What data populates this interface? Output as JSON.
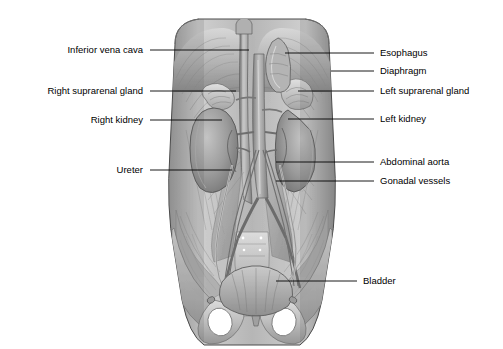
{
  "figure": {
    "view": "anterior view of posterior abdominal wall and pelvis",
    "style": "grayscale medical illustration",
    "background_color": "#ffffff",
    "leader_line_color": "#000000",
    "label_text_color": "#000000"
  },
  "labels_left": [
    {
      "id": "inferior-vena-cava",
      "text": "Inferior vena cava",
      "text_x": 143,
      "text_y": 50,
      "line_x1": 150,
      "line_x2": 249,
      "line_y": 50
    },
    {
      "id": "right-suprarenal-gland",
      "text": "Right suprarenal gland",
      "text_x": 143,
      "text_y": 91,
      "line_x1": 150,
      "line_x2": 236,
      "line_y": 91
    },
    {
      "id": "right-kidney",
      "text": "Right kidney",
      "text_x": 143,
      "text_y": 120,
      "line_x1": 150,
      "line_x2": 222,
      "line_y": 120
    },
    {
      "id": "ureter",
      "text": "Ureter",
      "text_x": 143,
      "text_y": 170,
      "line_x1": 150,
      "line_x2": 232,
      "line_y": 170
    }
  ],
  "labels_right": [
    {
      "id": "esophagus",
      "text": "Esophagus",
      "text_x": 380,
      "text_y": 53,
      "line_x1": 285,
      "line_x2": 374,
      "line_y": 53
    },
    {
      "id": "diaphragm",
      "text": "Diaphragm",
      "text_x": 380,
      "text_y": 71,
      "line_x1": 331,
      "line_x2": 374,
      "line_y": 71
    },
    {
      "id": "left-suprarenal-gland",
      "text": "Left suprarenal gland",
      "text_x": 380,
      "text_y": 91,
      "line_x1": 298,
      "line_x2": 374,
      "line_y": 91
    },
    {
      "id": "left-kidney",
      "text": "Left kidney",
      "text_x": 380,
      "text_y": 119,
      "line_x1": 288,
      "line_x2": 374,
      "line_y": 119
    },
    {
      "id": "abdominal-aorta",
      "text": "Abdominal aorta",
      "text_x": 380,
      "text_y": 162,
      "line_x1": 276,
      "line_x2": 374,
      "line_y": 162
    },
    {
      "id": "gonadal-vessels",
      "text": "Gonadal vessels",
      "text_x": 380,
      "text_y": 181,
      "line_x1": 276,
      "line_x2": 374,
      "line_y": 181
    },
    {
      "id": "bladder",
      "text": "Bladder",
      "text_x": 363,
      "text_y": 281,
      "line_x1": 276,
      "line_x2": 357,
      "line_y": 281
    }
  ],
  "palette": {
    "outline": "#3a3a3a",
    "muscle_light": "#c8c8c8",
    "muscle_mid": "#a8a8a8",
    "muscle_dark": "#7d7d7d",
    "organ_light": "#b5b5b5",
    "organ_mid": "#8e8e8e",
    "organ_dark": "#666666",
    "bone_light": "#d2d2d2",
    "bone_mid": "#b0b0b0",
    "vessel": "#9a9a9a",
    "highlight": "#e4e4e4"
  }
}
